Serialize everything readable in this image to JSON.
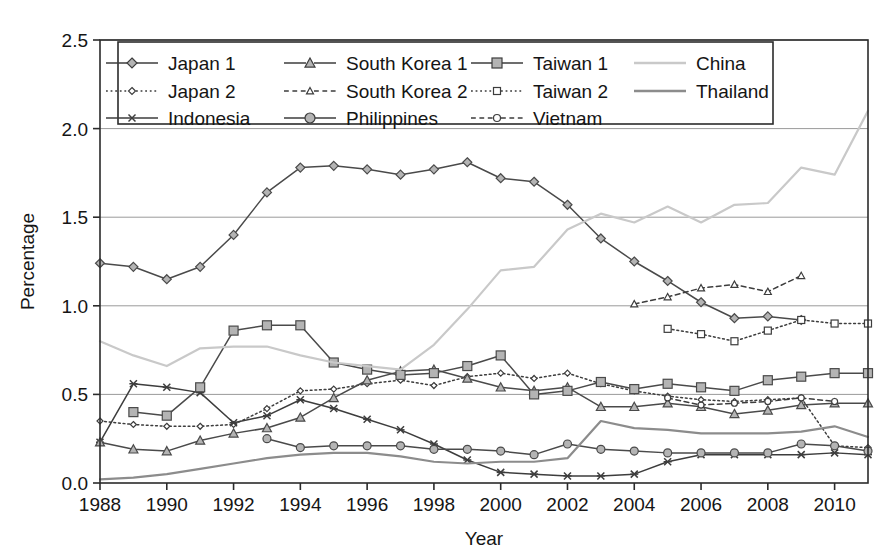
{
  "chart_data": {
    "type": "line",
    "title": "",
    "xlabel": "Year",
    "ylabel": "Percentage",
    "xlim": [
      1988,
      2011
    ],
    "ylim": [
      0.0,
      2.5
    ],
    "ytick_labels": [
      "0.0",
      "0.5",
      "1.0",
      "1.5",
      "2.0",
      "2.5"
    ],
    "ytick_values": [
      0.0,
      0.5,
      1.0,
      1.5,
      2.0,
      2.5
    ],
    "xtick_labels": [
      "1988",
      "1990",
      "1992",
      "1994",
      "1996",
      "1998",
      "2000",
      "2002",
      "2004",
      "2006",
      "2008",
      "2010"
    ],
    "xtick_values": [
      1988,
      1990,
      1992,
      1994,
      1996,
      1998,
      2000,
      2002,
      2004,
      2006,
      2008,
      2010
    ],
    "grid": "horizontal",
    "legend_position": "top-inside",
    "series": [
      {
        "name": "Japan 1",
        "marker": "diamond-filled",
        "line": "solid",
        "color": "#4a4a4a",
        "marker_fill": "#b4b4b4",
        "marker_size": 9,
        "x": [
          1988,
          1989,
          1990,
          1991,
          1992,
          1993,
          1994,
          1995,
          1996,
          1997,
          1998,
          1999,
          2000,
          2001,
          2002,
          2003,
          2004,
          2005,
          2006,
          2007,
          2008,
          2009
        ],
        "values": [
          1.24,
          1.22,
          1.15,
          1.22,
          1.4,
          1.64,
          1.78,
          1.79,
          1.77,
          1.74,
          1.77,
          1.81,
          1.72,
          1.7,
          1.57,
          1.38,
          1.25,
          1.14,
          1.02,
          0.93,
          0.94,
          0.92
        ]
      },
      {
        "name": "Japan 2",
        "marker": "diamond-open",
        "line": "dotted",
        "color": "#3d3d3d",
        "marker_fill": "#ffffff",
        "marker_size": 6,
        "x": [
          1988,
          1989,
          1990,
          1991,
          1992,
          1993,
          1994,
          1995,
          1996,
          1997,
          1998,
          1999,
          2000,
          2001,
          2002,
          2003,
          2004,
          2005,
          2006,
          2007,
          2008,
          2009,
          2010,
          2011
        ],
        "values": [
          0.35,
          0.33,
          0.32,
          0.32,
          0.33,
          0.42,
          0.52,
          0.53,
          0.56,
          0.58,
          0.55,
          0.6,
          0.62,
          0.59,
          0.62,
          0.56,
          0.52,
          0.49,
          0.47,
          0.46,
          0.47,
          0.48,
          0.21,
          0.2
        ]
      },
      {
        "name": "Indonesia",
        "marker": "cross",
        "line": "solid",
        "color": "#3d3d3d",
        "marker_fill": "#3d3d3d",
        "marker_size": 7,
        "x": [
          1988,
          1989,
          1990,
          1991,
          1992,
          1993,
          1994,
          1995,
          1996,
          1997,
          1998,
          1999,
          2000,
          2001,
          2002,
          2003,
          2004,
          2005,
          2006,
          2007,
          2008,
          2009,
          2010,
          2011
        ],
        "values": [
          0.23,
          0.56,
          0.54,
          0.51,
          0.34,
          0.38,
          0.47,
          0.42,
          0.36,
          0.3,
          0.22,
          0.13,
          0.06,
          0.05,
          0.04,
          0.04,
          0.05,
          0.12,
          0.16,
          0.16,
          0.16,
          0.16,
          0.17,
          0.16
        ]
      },
      {
        "name": "South Korea 1",
        "marker": "triangle-filled",
        "line": "solid",
        "color": "#4a4a4a",
        "marker_fill": "#b4b4b4",
        "marker_size": 9,
        "x": [
          1988,
          1989,
          1990,
          1991,
          1992,
          1993,
          1994,
          1995,
          1996,
          1997,
          1998,
          1999,
          2000,
          2001,
          2002,
          2003,
          2004,
          2005,
          2006,
          2007,
          2008,
          2009,
          2010,
          2011
        ],
        "values": [
          0.23,
          0.19,
          0.18,
          0.24,
          0.28,
          0.31,
          0.37,
          0.48,
          0.58,
          0.63,
          0.64,
          0.59,
          0.54,
          0.52,
          0.54,
          0.43,
          0.43,
          0.45,
          0.43,
          0.39,
          0.41,
          0.44,
          0.45,
          0.45
        ]
      },
      {
        "name": "South Korea 2",
        "marker": "triangle-open",
        "line": "dashed",
        "color": "#3d3d3d",
        "marker_fill": "#ffffff",
        "marker_size": 7,
        "x": [
          2004,
          2005,
          2006,
          2007,
          2008,
          2009
        ],
        "values": [
          1.01,
          1.05,
          1.1,
          1.12,
          1.08,
          1.17
        ]
      },
      {
        "name": "Philippines",
        "marker": "circle-filled",
        "line": "solid",
        "color": "#4a4a4a",
        "marker_fill": "#b4b4b4",
        "marker_size": 8,
        "x": [
          1993,
          1994,
          1995,
          1996,
          1997,
          1998,
          1999,
          2000,
          2001,
          2002,
          2003,
          2004,
          2005,
          2006,
          2007,
          2008,
          2009,
          2010,
          2011
        ],
        "values": [
          0.25,
          0.2,
          0.21,
          0.21,
          0.21,
          0.19,
          0.19,
          0.18,
          0.16,
          0.22,
          0.19,
          0.18,
          0.17,
          0.17,
          0.17,
          0.17,
          0.22,
          0.21,
          0.18
        ]
      },
      {
        "name": "Taiwan 1",
        "marker": "square-filled",
        "line": "solid",
        "color": "#4a4a4a",
        "marker_fill": "#b4b4b4",
        "marker_size": 9,
        "x": [
          1989,
          1990,
          1991,
          1992,
          1993,
          1994,
          1995,
          1996,
          1997,
          1998,
          1999,
          2000,
          2001,
          2002,
          2003,
          2004,
          2005,
          2006,
          2007,
          2008,
          2009,
          2010,
          2011
        ],
        "values": [
          0.4,
          0.38,
          0.54,
          0.86,
          0.89,
          0.89,
          0.68,
          0.64,
          0.61,
          0.62,
          0.66,
          0.72,
          0.5,
          0.52,
          0.57,
          0.53,
          0.56,
          0.54,
          0.52,
          0.58,
          0.6,
          0.62,
          0.62
        ]
      },
      {
        "name": "Taiwan 2",
        "marker": "square-open",
        "line": "dotted",
        "color": "#3d3d3d",
        "marker_fill": "#ffffff",
        "marker_size": 7,
        "x": [
          2005,
          2006,
          2007,
          2008,
          2009,
          2010,
          2011
        ],
        "values": [
          0.87,
          0.84,
          0.8,
          0.86,
          0.92,
          0.9,
          0.9
        ]
      },
      {
        "name": "Vietnam",
        "marker": "circle-open",
        "line": "dashed",
        "color": "#3d3d3d",
        "marker_fill": "#ffffff",
        "marker_size": 6,
        "x": [
          2005,
          2006,
          2007,
          2008,
          2009,
          2010
        ],
        "values": [
          0.48,
          0.44,
          0.45,
          0.46,
          0.48,
          0.46
        ]
      },
      {
        "name": "China",
        "marker": "none",
        "line": "solid",
        "color": "#c9c9c9",
        "marker_fill": "#c9c9c9",
        "marker_size": 0,
        "x": [
          1988,
          1989,
          1990,
          1991,
          1992,
          1993,
          1994,
          1995,
          1996,
          1997,
          1998,
          1999,
          2000,
          2001,
          2002,
          2003,
          2004,
          2005,
          2006,
          2007,
          2008,
          2009,
          2010,
          2011
        ],
        "values": [
          0.8,
          0.72,
          0.66,
          0.76,
          0.77,
          0.77,
          0.72,
          0.68,
          0.66,
          0.64,
          0.78,
          0.98,
          1.2,
          1.22,
          1.43,
          1.52,
          1.47,
          1.56,
          1.47,
          1.57,
          1.58,
          1.78,
          1.74,
          2.1
        ]
      },
      {
        "name": "Thailand",
        "marker": "none",
        "line": "solid",
        "color": "#8c8c8c",
        "marker_fill": "#8c8c8c",
        "marker_size": 0,
        "x": [
          1988,
          1989,
          1990,
          1991,
          1992,
          1993,
          1994,
          1995,
          1996,
          1997,
          1998,
          1999,
          2000,
          2001,
          2002,
          2003,
          2004,
          2005,
          2006,
          2007,
          2008,
          2009,
          2010,
          2011
        ],
        "values": [
          0.02,
          0.03,
          0.05,
          0.08,
          0.11,
          0.14,
          0.16,
          0.17,
          0.17,
          0.15,
          0.12,
          0.11,
          0.12,
          0.12,
          0.14,
          0.35,
          0.31,
          0.3,
          0.28,
          0.28,
          0.28,
          0.29,
          0.32,
          0.26
        ]
      }
    ],
    "legend_entries": [
      {
        "label": "Japan 1",
        "marker": "diamond-filled",
        "line": "solid"
      },
      {
        "label": "South Korea 1",
        "marker": "triangle-filled",
        "line": "solid"
      },
      {
        "label": "Taiwan 1",
        "marker": "square-filled",
        "line": "solid"
      },
      {
        "label": "China",
        "marker": "none",
        "line": "solid-light"
      },
      {
        "label": "Japan 2",
        "marker": "diamond-open",
        "line": "dotted"
      },
      {
        "label": "South Korea 2",
        "marker": "triangle-open",
        "line": "dashed"
      },
      {
        "label": "Taiwan 2",
        "marker": "square-open",
        "line": "dotted"
      },
      {
        "label": "Thailand",
        "marker": "none",
        "line": "solid-mid"
      },
      {
        "label": "Indonesia",
        "marker": "cross",
        "line": "solid"
      },
      {
        "label": "Philippines",
        "marker": "circle-filled",
        "line": "solid"
      },
      {
        "label": "Vietnam",
        "marker": "circle-open",
        "line": "dashed"
      }
    ]
  }
}
